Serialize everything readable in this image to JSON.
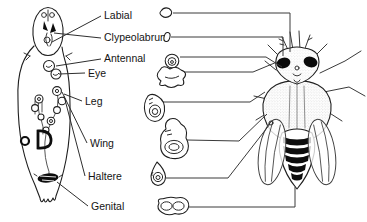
{
  "diagram": {
    "labels": [
      {
        "id": "labial",
        "text": "Labial"
      },
      {
        "id": "clypeolabrum",
        "text": "Clypeolabrum"
      },
      {
        "id": "antennal",
        "text": "Antennal"
      },
      {
        "id": "eye",
        "text": "Eye"
      },
      {
        "id": "leg",
        "text": "Leg"
      },
      {
        "id": "wing",
        "text": "Wing"
      },
      {
        "id": "haltere",
        "text": "Haltere"
      },
      {
        "id": "genital",
        "text": "Genital"
      }
    ],
    "colors": {
      "ink": "#1a1a1a",
      "line": "#3a3a3a",
      "background": "#ffffff"
    }
  }
}
